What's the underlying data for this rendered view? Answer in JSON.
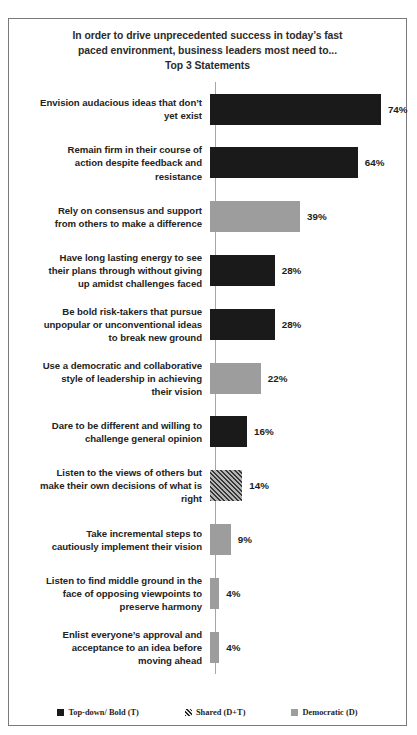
{
  "chart_data": {
    "type": "bar",
    "orientation": "horizontal",
    "title_lines": [
      "In order to drive unprecedented success in today’s fast",
      "paced environment, business leaders most need to...",
      "Top 3 Statements"
    ],
    "xlabel": "",
    "ylabel": "",
    "xlim": [
      0,
      80
    ],
    "grid": false,
    "legend_position": "bottom",
    "value_suffix": "%",
    "categories": [
      "Envision audacious ideas that don’t yet exist",
      "Remain firm in their course of action despite feedback and resistance",
      "Rely on consensus and support from others to make a difference",
      "Have long lasting energy to see their plans through without giving up amidst challenges faced",
      "Be bold risk-takers  that pursue unpopular or unconventional ideas to break new ground",
      "Use a democratic and collaborative style of leadership  in achieving their vision",
      "Dare to be different and willing to challenge  general opinion",
      "Listen to the views of others but make their own decisions of what is right",
      "Take incremental steps to cautiously implement their vision",
      "Listen to find middle ground in the face of opposing viewpoints  to preserve harmony",
      "Enlist everyone’s approval and acceptance to an idea before moving ahead"
    ],
    "values": [
      74,
      64,
      39,
      28,
      28,
      22,
      16,
      14,
      9,
      4,
      4
    ],
    "value_labels": [
      "74%",
      "64%",
      "39%",
      "28%",
      "28%",
      "22%",
      "16%",
      "14%",
      "9%",
      "4%",
      "4%"
    ],
    "series_of_bar": [
      "topdown",
      "topdown",
      "democratic",
      "topdown",
      "topdown",
      "democratic",
      "topdown",
      "shared",
      "democratic",
      "democratic",
      "democratic"
    ],
    "legend": [
      {
        "key": "topdown",
        "label": "Top-down/ Bold (T)",
        "color": "#1a1a1a",
        "pattern": "solid"
      },
      {
        "key": "shared",
        "label": "Shared (D+T)",
        "color": "#8f8f8f",
        "pattern": "diagonal-hatch"
      },
      {
        "key": "democratic",
        "label": "Democratic (D)",
        "color": "#9d9d9d",
        "pattern": "solid"
      }
    ],
    "bars": [
      {
        "label": "Envision audacious ideas that don’t yet exist",
        "label_lines": [
          "Envision audacious ideas that don’t",
          "yet exist"
        ],
        "value": 74,
        "value_label": "74%",
        "series": "topdown"
      },
      {
        "label": "Remain firm in their course of action despite feedback and resistance",
        "label_lines": [
          "Remain firm in their course of",
          "action despite feedback and",
          "resistance"
        ],
        "value": 64,
        "value_label": "64%",
        "series": "topdown"
      },
      {
        "label": "Rely on consensus and support from others to make a difference",
        "label_lines": [
          "Rely on consensus and support",
          "from others to make a difference"
        ],
        "value": 39,
        "value_label": "39%",
        "series": "democratic"
      },
      {
        "label": "Have long lasting energy to see their plans through without giving up amidst challenges faced",
        "label_lines": [
          "Have long lasting energy to see",
          "their plans through without giving",
          "up amidst challenges faced"
        ],
        "value": 28,
        "value_label": "28%",
        "series": "topdown"
      },
      {
        "label": "Be bold risk-takers  that pursue unpopular or unconventional ideas to break new ground",
        "label_lines": [
          "Be bold risk-takers  that pursue",
          "unpopular or unconventional ideas",
          "to break new ground"
        ],
        "value": 28,
        "value_label": "28%",
        "series": "topdown"
      },
      {
        "label": "Use a democratic and collaborative style of leadership  in achieving their vision",
        "label_lines": [
          "Use a democratic and collaborative",
          "style of leadership  in achieving",
          "their vision"
        ],
        "value": 22,
        "value_label": "22%",
        "series": "democratic"
      },
      {
        "label": "Dare to be different and willing to challenge  general opinion",
        "label_lines": [
          "Dare to be different and willing to",
          "challenge  general opinion"
        ],
        "value": 16,
        "value_label": "16%",
        "series": "topdown"
      },
      {
        "label": "Listen to the views of others but make their own decisions of what is right",
        "label_lines": [
          "Listen to the views of others but",
          "make their own decisions of what is",
          "right"
        ],
        "value": 14,
        "value_label": "14%",
        "series": "shared"
      },
      {
        "label": "Take incremental steps to cautiously implement their vision",
        "label_lines": [
          "Take incremental steps to",
          "cautiously implement their vision"
        ],
        "value": 9,
        "value_label": "9%",
        "series": "democratic"
      },
      {
        "label": "Listen to find middle ground in the face of opposing viewpoints  to preserve harmony",
        "label_lines": [
          "Listen to find middle ground in the",
          "face of opposing viewpoints  to",
          "preserve harmony"
        ],
        "value": 4,
        "value_label": "4%",
        "series": "democratic"
      },
      {
        "label": "Enlist everyone’s approval and acceptance to an idea before moving ahead",
        "label_lines": [
          "Enlist everyone’s approval and",
          "acceptance to an idea before",
          "moving ahead"
        ],
        "value": 4,
        "value_label": "4%",
        "series": "democratic"
      }
    ]
  }
}
